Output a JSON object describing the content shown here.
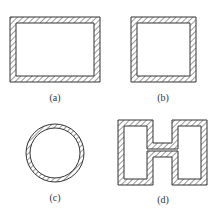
{
  "figure": {
    "panels": [
      {
        "id": "a",
        "label": "(a)",
        "shape": "rectangle"
      },
      {
        "id": "b",
        "label": "(b)",
        "shape": "square"
      },
      {
        "id": "c",
        "label": "(c)",
        "shape": "circle"
      },
      {
        "id": "d",
        "label": "(d)",
        "shape": "H-section"
      }
    ],
    "colors": {
      "stroke": "#333333",
      "hatch": "#555555",
      "background": "#ffffff"
    }
  }
}
